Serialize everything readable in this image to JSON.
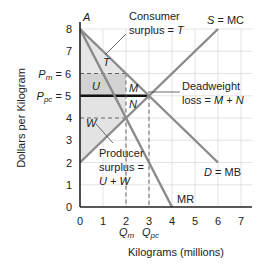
{
  "chart_data": {
    "type": "line",
    "title": "",
    "xlabel": "Kilograms (millions)",
    "ylabel": "Dollars per Kilogram",
    "xlim": [
      0,
      7
    ],
    "ylim": [
      0,
      8
    ],
    "x_ticks": [
      0,
      1,
      2,
      3,
      4,
      5,
      6,
      7
    ],
    "y_ticks": [
      0,
      1,
      2,
      3,
      4,
      5,
      6,
      7,
      8
    ],
    "grid": true,
    "series": [
      {
        "name": "D = MB",
        "points": [
          [
            0,
            8
          ],
          [
            6,
            2
          ]
        ],
        "color": "#8a8a8a"
      },
      {
        "name": "S = MC",
        "points": [
          [
            0,
            2
          ],
          [
            6,
            8
          ]
        ],
        "color": "#8a8a8a"
      },
      {
        "name": "MR",
        "points": [
          [
            0,
            8
          ],
          [
            4,
            0
          ]
        ],
        "color": "#8a8a8a"
      }
    ],
    "reference_lines": [
      {
        "name": "P_m = 6",
        "type": "horizontal",
        "y": 6,
        "x_to": 2,
        "style": "dashed"
      },
      {
        "name": "P_pc = 5",
        "type": "horizontal",
        "y": 5,
        "x_to": 3,
        "style": "solid-bold"
      },
      {
        "name": "MR=MC level",
        "type": "horizontal",
        "y": 4,
        "x_to": 2,
        "style": "dashed"
      },
      {
        "name": "Q_m",
        "type": "vertical",
        "x": 2,
        "style": "dashed"
      },
      {
        "name": "Q_pc",
        "type": "vertical",
        "x": 3,
        "style": "dashed"
      }
    ],
    "regions": [
      {
        "label": "T",
        "desc": "Consumer surplus",
        "polygon": [
          [
            0,
            8
          ],
          [
            2,
            6
          ],
          [
            0,
            6
          ]
        ],
        "fill": "#e6e6e6"
      },
      {
        "label": "U",
        "desc": "Part of producer surplus",
        "polygon": [
          [
            0,
            6
          ],
          [
            2,
            6
          ],
          [
            2,
            5
          ],
          [
            0,
            5
          ]
        ],
        "fill": "#d2d2d2"
      },
      {
        "label": "W",
        "desc": "Part of producer surplus",
        "polygon": [
          [
            0,
            5
          ],
          [
            2,
            5
          ],
          [
            2,
            4
          ],
          [
            0,
            2
          ]
        ],
        "fill": "#e3e3e3"
      },
      {
        "label": "M",
        "desc": "Deadweight loss (upper)",
        "polygon": [
          [
            2,
            6
          ],
          [
            3,
            5
          ],
          [
            2,
            5
          ]
        ],
        "fill": "#ffffff"
      },
      {
        "label": "N",
        "desc": "Deadweight loss (lower)",
        "polygon": [
          [
            2,
            5
          ],
          [
            3,
            5
          ],
          [
            2,
            4
          ]
        ],
        "fill": "#ffffff"
      }
    ],
    "annotations": [
      {
        "text": "A",
        "x": 0,
        "y": 8
      },
      {
        "text": "Consumer surplus = T"
      },
      {
        "text": "S = MC"
      },
      {
        "text": "Deadweight loss = M + N"
      },
      {
        "text": "Producer surplus = U + W"
      },
      {
        "text": "D = MB"
      },
      {
        "text": "MR"
      }
    ],
    "y_special_labels": [
      {
        "text": "P_m = 6",
        "y": 6
      },
      {
        "text": "P_pc = 5",
        "y": 5
      }
    ],
    "x_special_labels": [
      {
        "text": "Q_m",
        "x": 2
      },
      {
        "text": "Q_pc",
        "x": 3
      }
    ]
  },
  "labels": {
    "y_axis_title": "Dollars per Kilogram",
    "x_axis_title": "Kilograms (millions)",
    "point_a": "A",
    "consumer_line1": "Consumer",
    "consumer_line2": "surplus = ",
    "consumer_var": "T",
    "supply": "S",
    "supply_rest": " = MC",
    "dw_line1": "Deadweight",
    "dw_line2a": "loss = ",
    "dw_line2b": "M",
    "dw_line2c": " + ",
    "dw_line2d": "N",
    "prod_line1": "Producer",
    "prod_line2": "surplus =",
    "prod_line3": "U + W",
    "demand": "D",
    "demand_rest": " = MB",
    "mr": "MR",
    "region_t": "T",
    "region_u": "U",
    "region_w": "W",
    "region_m": "M",
    "region_n": "N",
    "pm_p": "P",
    "pm_sub": "m",
    "pm_rest": " = 6",
    "ppc_p": "P",
    "ppc_sub": "pc",
    "ppc_rest": " = 5",
    "qm_q": "Q",
    "qm_sub": "m",
    "qpc_q": "Q",
    "qpc_sub": "pc"
  }
}
